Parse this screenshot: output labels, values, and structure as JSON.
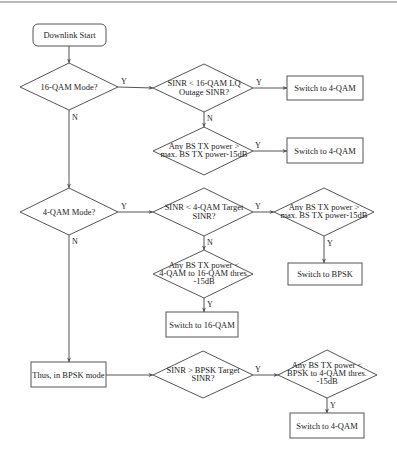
{
  "diagram": {
    "type": "flowchart",
    "nodes": {
      "start": {
        "shape": "rounded-rect",
        "lines": [
          "Downlink Start"
        ]
      },
      "q16_mode": {
        "shape": "diamond",
        "lines": [
          "16-QAM Mode?"
        ]
      },
      "sinr_16qam_outage": {
        "shape": "diamond",
        "lines": [
          "SINR < 16-QAM LQ",
          "Outage SINR?"
        ]
      },
      "switch_4qam_a": {
        "shape": "rect",
        "lines": [
          "Switch to 4-QAM"
        ]
      },
      "bs_tx_max_a": {
        "shape": "diamond",
        "lines": [
          "Any BS TX power >",
          "max. BS TX power-15dB"
        ]
      },
      "switch_4qam_b": {
        "shape": "rect",
        "lines": [
          "Switch to 4-QAM"
        ]
      },
      "q4_mode": {
        "shape": "diamond",
        "lines": [
          "4-QAM Mode?"
        ]
      },
      "sinr_4qam_target": {
        "shape": "diamond",
        "lines": [
          "SINR < 4-QAM Target",
          "SINR?"
        ]
      },
      "bs_tx_max_b": {
        "shape": "diamond",
        "lines": [
          "Any BS TX power >",
          "max. BS TX power-15dB"
        ]
      },
      "switch_bpsk": {
        "shape": "rect",
        "lines": [
          "Switch to BPSK"
        ]
      },
      "bs_tx_4to16": {
        "shape": "diamond",
        "lines": [
          "Any BS TX power <",
          "4-QAM to 16-QAM thres.",
          "-15dB"
        ]
      },
      "switch_16qam": {
        "shape": "rect",
        "lines": [
          "Switch to 16-QAM"
        ]
      },
      "bpsk_mode": {
        "shape": "rect",
        "lines": [
          "Thus, in BPSK mode"
        ]
      },
      "sinr_bpsk_target": {
        "shape": "diamond",
        "lines": [
          "SINR > BPSK Target",
          "SINR?"
        ]
      },
      "bs_tx_bpsk_to_4": {
        "shape": "diamond",
        "lines": [
          "Any BS TX power <",
          "BPSK to 4-QAM thres.",
          "-15dB"
        ]
      },
      "switch_4qam_c": {
        "shape": "rect",
        "lines": [
          "Switch to 4-QAM"
        ]
      }
    },
    "edges": [
      {
        "from": "start",
        "to": "q16_mode",
        "label": ""
      },
      {
        "from": "q16_mode",
        "to": "sinr_16qam_outage",
        "label": "Y"
      },
      {
        "from": "q16_mode",
        "to": "q4_mode",
        "label": "N"
      },
      {
        "from": "sinr_16qam_outage",
        "to": "switch_4qam_a",
        "label": "Y"
      },
      {
        "from": "sinr_16qam_outage",
        "to": "bs_tx_max_a",
        "label": "N"
      },
      {
        "from": "bs_tx_max_a",
        "to": "switch_4qam_b",
        "label": "Y"
      },
      {
        "from": "q4_mode",
        "to": "sinr_4qam_target",
        "label": "Y"
      },
      {
        "from": "q4_mode",
        "to": "bpsk_mode",
        "label": "N"
      },
      {
        "from": "sinr_4qam_target",
        "to": "bs_tx_max_b",
        "label": "Y"
      },
      {
        "from": "sinr_4qam_target",
        "to": "bs_tx_4to16",
        "label": "N"
      },
      {
        "from": "bs_tx_max_b",
        "to": "switch_bpsk",
        "label": "Y"
      },
      {
        "from": "bs_tx_4to16",
        "to": "switch_16qam",
        "label": "Y"
      },
      {
        "from": "bpsk_mode",
        "to": "sinr_bpsk_target",
        "label": ""
      },
      {
        "from": "sinr_bpsk_target",
        "to": "bs_tx_bpsk_to_4",
        "label": "Y"
      },
      {
        "from": "bs_tx_bpsk_to_4",
        "to": "switch_4qam_c",
        "label": "Y"
      }
    ],
    "edge_labels": {
      "yes": "Y",
      "no": "N"
    }
  }
}
